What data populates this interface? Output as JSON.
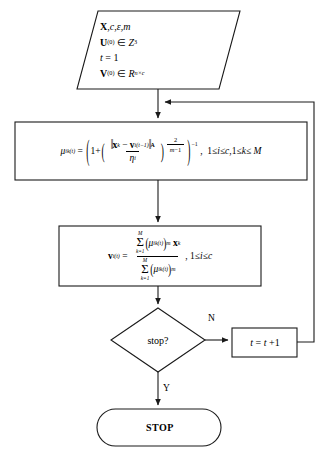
{
  "diagram": {
    "type": "flowchart",
    "nodes": [
      {
        "id": "input",
        "shape": "parallelogram",
        "name": "input-node",
        "lines": [
          {
            "id": "line1",
            "text": "X, c, ε, m"
          },
          {
            "id": "line2",
            "text": "U(0) ∈ Z3"
          },
          {
            "id": "line3",
            "text": "t = 1"
          },
          {
            "id": "line4",
            "text": "V(0) ∈ R n×c"
          }
        ]
      },
      {
        "id": "membership",
        "shape": "rectangle",
        "name": "membership-update-node",
        "formula": "μik(t) = ( 1 + ( ‖xk − vi(t−1)‖A / ηi ) ^ (2/(m−1)) ) ^ −1",
        "condition": "1 ≤ i ≤ c, 1 ≤ k ≤ M",
        "parts": {
          "lhs_var": "μ",
          "lhs_sub": "ik",
          "lhs_sup": "(t)",
          "equals": "=",
          "one_plus": "1+",
          "norm_x": "x",
          "norm_x_sub": "k",
          "minus": "−",
          "norm_v": "v",
          "norm_v_sub": "i",
          "norm_v_sup": "(t−1)",
          "norm_label": "A",
          "denominator": "η",
          "denominator_sub": "i",
          "exp_num": "2",
          "exp_den": "m−1",
          "outer_exp": "−1"
        }
      },
      {
        "id": "centroid",
        "shape": "rectangle",
        "name": "centroid-update-node",
        "formula": "vi(t) = Σ k=1..M (μik(t))^m xk / Σ k=1..M (μik(t))^m",
        "condition": "1 ≤ i ≤ c",
        "parts": {
          "lhs_var": "v",
          "lhs_sub": "i",
          "lhs_sup": "(t)",
          "equals": "=",
          "sum_upper": "M",
          "sum_lower": "k=1",
          "sigma": "Σ",
          "mu": "μ",
          "mu_sub": "ik",
          "mu_sup": "(t)",
          "power_m": "m",
          "x_var": "x",
          "x_sub": "k"
        }
      },
      {
        "id": "decision",
        "shape": "diamond",
        "name": "stop-decision-node",
        "label": "stop?"
      },
      {
        "id": "increment",
        "shape": "rectangle",
        "name": "increment-node",
        "label": "t = t + 1",
        "parts": {
          "lhs": "t",
          "equals": "=",
          "rhs": "t + 1"
        }
      },
      {
        "id": "terminal",
        "shape": "rounded-rectangle",
        "name": "stop-terminal-node",
        "label": "STOP"
      }
    ],
    "edges": [
      {
        "id": "e1",
        "from": "input",
        "to": "membership",
        "label": ""
      },
      {
        "id": "e2",
        "from": "membership",
        "to": "centroid",
        "label": ""
      },
      {
        "id": "e3",
        "from": "centroid",
        "to": "decision",
        "label": ""
      },
      {
        "id": "e4",
        "from": "decision",
        "to": "increment",
        "label": "N"
      },
      {
        "id": "e5",
        "from": "increment",
        "to": "membership",
        "label": ""
      },
      {
        "id": "e6",
        "from": "decision",
        "to": "terminal",
        "label": "Y"
      }
    ],
    "branch_labels": {
      "no": "N",
      "yes": "Y"
    },
    "colors": {
      "background": "#ffffff",
      "stroke": "#1a1a1a",
      "text": "#000000"
    }
  }
}
